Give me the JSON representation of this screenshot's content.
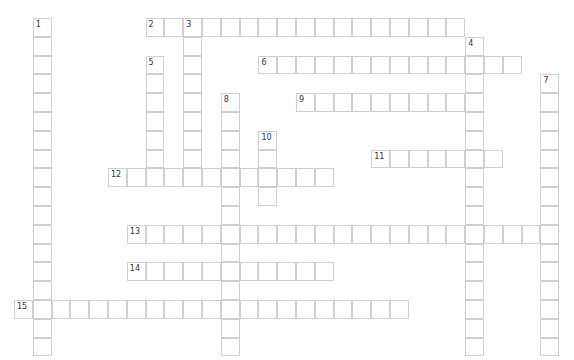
{
  "puzzle": {
    "type": "crossword",
    "cell_size": 18.8,
    "origin": {
      "x": 14,
      "y": 18
    },
    "colors": {
      "border": "#cfcfcf",
      "background": "#ffffff",
      "number": "#333333"
    },
    "entries": [
      {
        "number": "1",
        "direction": "down",
        "row": 0,
        "col": 1,
        "length": 18
      },
      {
        "number": "2",
        "direction": "across",
        "row": 0,
        "col": 7,
        "length": 17
      },
      {
        "number": "3",
        "direction": "down",
        "row": 0,
        "col": 9,
        "length": 9
      },
      {
        "number": "4",
        "direction": "down",
        "row": 1,
        "col": 24,
        "length": 17
      },
      {
        "number": "5",
        "direction": "down",
        "row": 2,
        "col": 7,
        "length": 7
      },
      {
        "number": "6",
        "direction": "across",
        "row": 2,
        "col": 13,
        "length": 14
      },
      {
        "number": "7",
        "direction": "down",
        "row": 3,
        "col": 28,
        "length": 15
      },
      {
        "number": "8",
        "direction": "down",
        "row": 4,
        "col": 11,
        "length": 14
      },
      {
        "number": "9",
        "direction": "across",
        "row": 4,
        "col": 15,
        "length": 10
      },
      {
        "number": "10",
        "direction": "down",
        "row": 6,
        "col": 13,
        "length": 4
      },
      {
        "number": "11",
        "direction": "across",
        "row": 7,
        "col": 19,
        "length": 7
      },
      {
        "number": "12",
        "direction": "across",
        "row": 8,
        "col": 5,
        "length": 12
      },
      {
        "number": "13",
        "direction": "across",
        "row": 11,
        "col": 6,
        "length": 23
      },
      {
        "number": "14",
        "direction": "across",
        "row": 13,
        "col": 6,
        "length": 11
      },
      {
        "number": "15",
        "direction": "across",
        "row": 15,
        "col": 0,
        "length": 21
      }
    ]
  }
}
